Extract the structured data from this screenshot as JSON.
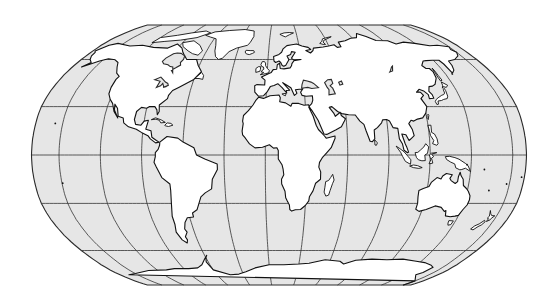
{
  "map": {
    "title": "World map (Robinson-style projection)",
    "projection": "Robinson",
    "graticule": {
      "meridian_step_deg": 30,
      "parallel_step_deg": 30,
      "central_meridian_deg": 10
    },
    "colors": {
      "ocean": "#e6e6e6",
      "land": "#ffffff",
      "outline": "#111111",
      "grid": "#333333"
    },
    "features": [
      "north-america",
      "greenland",
      "south-america",
      "europe",
      "africa",
      "asia",
      "arabia",
      "india",
      "southeast-asia",
      "australia",
      "new-zealand",
      "madagascar",
      "japan",
      "british-isles",
      "antarctica",
      "indonesia",
      "caribbean"
    ]
  }
}
